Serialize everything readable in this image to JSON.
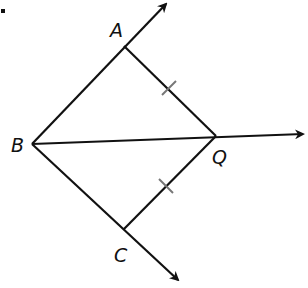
{
  "diagram": {
    "type": "geometry",
    "points": {
      "A": {
        "label": "A",
        "x": 124,
        "y": 46
      },
      "B": {
        "label": "B",
        "x": 32,
        "y": 144
      },
      "C": {
        "label": "C",
        "x": 124,
        "y": 229
      },
      "Q": {
        "label": "Q",
        "x": 216,
        "y": 136
      }
    },
    "rays": [
      {
        "name": "BA",
        "from": "B",
        "through": "A",
        "tip": [
          168,
          2
        ]
      },
      {
        "name": "BQ",
        "from": "B",
        "through": "Q",
        "tip": [
          305,
          134
        ]
      },
      {
        "name": "BC",
        "from": "B",
        "through": "C",
        "tip": [
          180,
          282
        ]
      }
    ],
    "segments": [
      {
        "name": "AQ",
        "from": "A",
        "to": "Q",
        "tick_marks": 1
      },
      {
        "name": "CQ",
        "from": "C",
        "to": "Q",
        "tick_marks": 1
      }
    ],
    "bullet": "•",
    "colors": {
      "line": "#111111",
      "tick": "#777777"
    }
  }
}
